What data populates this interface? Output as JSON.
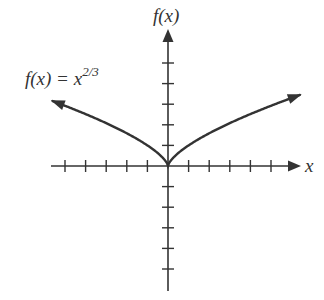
{
  "chart_data": {
    "type": "line",
    "title": "",
    "xlabel": "x",
    "ylabel": "f(x)",
    "function_label": {
      "base": "f(x) = x",
      "exponent": "2/3"
    },
    "series": [
      {
        "name": "f(x) = x^(2/3)",
        "formula": "x^(2/3)",
        "x_range": [
          -5.6,
          6.4
        ],
        "arrows_both_ends": true
      }
    ],
    "x_ticks": [
      -5,
      -4,
      -3,
      -2,
      -1,
      1,
      2,
      3,
      4,
      5
    ],
    "y_ticks": [
      -5,
      -4,
      -3,
      -2,
      -1,
      1,
      2,
      3,
      4,
      5
    ],
    "tick_labels_shown": false,
    "xlim": [
      -5.7,
      6.5
    ],
    "ylim": [
      -6.1,
      6.7
    ],
    "grid": false,
    "legend": "none",
    "color": "#333333"
  },
  "labels": {
    "y_axis": "f(x)",
    "x_axis": "x",
    "function_base": "f(x) = x",
    "function_exp": "2/3"
  }
}
